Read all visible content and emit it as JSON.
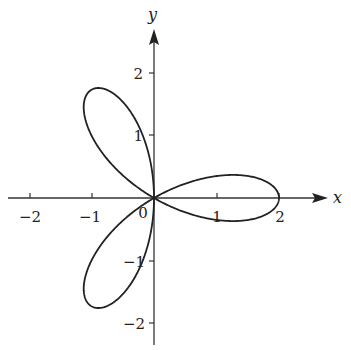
{
  "chart_data": {
    "type": "line",
    "title": "",
    "curve": "polar rose r = 2cos(3θ)",
    "equation": {
      "r_amplitude": 2,
      "k": 3
    },
    "xlabel": "x",
    "ylabel": "y",
    "xlim": [
      -2.3,
      2.8
    ],
    "ylim": [
      -2.4,
      2.7
    ],
    "x_ticks": [
      -2,
      -1,
      1,
      2
    ],
    "x_tick_labels": [
      "−2",
      "−1",
      "1",
      "2"
    ],
    "y_ticks": [
      2,
      1,
      -1,
      -2
    ],
    "y_tick_labels": [
      "2",
      "1",
      "−1",
      "−2"
    ],
    "origin_label": "0",
    "grid": false,
    "legend": null,
    "petal_tips": [
      {
        "x": 2,
        "y": 0
      },
      {
        "x": -1,
        "y": 1.732
      },
      {
        "x": -1,
        "y": -1.732
      }
    ]
  },
  "axes": {
    "x_name": "x",
    "y_name": "y",
    "origin": "0",
    "x_labels": [
      "−2",
      "−1",
      "1",
      "2"
    ],
    "y_labels": [
      "2",
      "1",
      "−1",
      "−2"
    ]
  },
  "style": {
    "stroke_color": "#222222",
    "background": "#ffffff"
  }
}
